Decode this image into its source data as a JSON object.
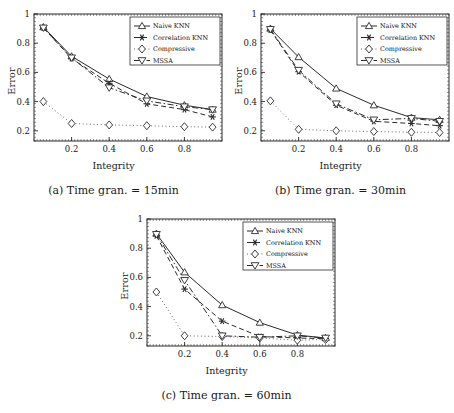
{
  "figure": {
    "ylabel": "Error",
    "xlabel": "Integrity",
    "yticks": [
      "0.2",
      "0.4",
      "0.6",
      "0.8",
      "1"
    ],
    "xticks": [
      "0.2",
      "0.4",
      "0.6",
      "0.8"
    ],
    "legend": [
      {
        "label": "Naive KNN",
        "marker": "triangle-up-icon",
        "line": "solid"
      },
      {
        "label": "Correlation KNN",
        "marker": "asterisk-icon",
        "line": "dashed"
      },
      {
        "label": "Compressive",
        "marker": "diamond-icon",
        "line": "dotted"
      },
      {
        "label": "MSSA",
        "marker": "triangle-down-icon",
        "line": "dashdot"
      }
    ]
  },
  "chart_data": [
    {
      "type": "line",
      "panel": "a",
      "title": "(a) Time gran. = 15min",
      "xlabel": "Integrity",
      "ylabel": "Error",
      "xlim": [
        0.0,
        1.0
      ],
      "ylim": [
        0.13,
        1.0
      ],
      "xticks": [
        0.2,
        0.4,
        0.6,
        0.8
      ],
      "yticks": [
        0.2,
        0.4,
        0.6,
        0.8,
        1.0
      ],
      "grid": false,
      "legend_position": "upper right",
      "x": [
        0.05,
        0.2,
        0.4,
        0.6,
        0.8,
        0.95
      ],
      "series": [
        {
          "name": "Naive KNN",
          "values": [
            0.91,
            0.71,
            0.555,
            0.435,
            0.375,
            0.345
          ]
        },
        {
          "name": "Correlation KNN",
          "values": [
            0.905,
            0.695,
            0.525,
            0.385,
            0.345,
            0.295
          ]
        },
        {
          "name": "Compressive",
          "values": [
            0.4,
            0.25,
            0.24,
            0.235,
            0.228,
            0.225
          ]
        },
        {
          "name": "MSSA",
          "values": [
            0.905,
            0.7,
            0.495,
            0.405,
            0.365,
            0.345
          ]
        }
      ]
    },
    {
      "type": "line",
      "panel": "b",
      "title": "(b) Time gran. = 30min",
      "xlabel": "Integrity",
      "ylabel": "Error",
      "xlim": [
        0.0,
        1.0
      ],
      "ylim": [
        0.13,
        1.0
      ],
      "xticks": [
        0.2,
        0.4,
        0.6,
        0.8
      ],
      "yticks": [
        0.2,
        0.4,
        0.6,
        0.8,
        1.0
      ],
      "grid": false,
      "legend_position": "upper right",
      "x": [
        0.05,
        0.2,
        0.4,
        0.6,
        0.8,
        0.95
      ],
      "series": [
        {
          "name": "Naive KNN",
          "values": [
            0.9,
            0.705,
            0.49,
            0.375,
            0.29,
            0.275
          ]
        },
        {
          "name": "Correlation KNN",
          "values": [
            0.89,
            0.605,
            0.375,
            0.265,
            0.25,
            0.235
          ]
        },
        {
          "name": "Compressive",
          "values": [
            0.405,
            0.21,
            0.2,
            0.195,
            0.19,
            0.188
          ]
        },
        {
          "name": "MSSA",
          "values": [
            0.895,
            0.615,
            0.385,
            0.275,
            0.285,
            0.265
          ]
        }
      ]
    },
    {
      "type": "line",
      "panel": "c",
      "title": "(c) Time gran. = 60min",
      "xlabel": "Integrity",
      "ylabel": "Error",
      "xlim": [
        0.0,
        1.0
      ],
      "ylim": [
        0.13,
        1.0
      ],
      "xticks": [
        0.2,
        0.4,
        0.6,
        0.8
      ],
      "yticks": [
        0.2,
        0.4,
        0.6,
        0.8,
        1.0
      ],
      "grid": false,
      "legend_position": "upper right",
      "x": [
        0.05,
        0.2,
        0.4,
        0.6,
        0.8,
        0.95
      ],
      "series": [
        {
          "name": "Naive KNN",
          "values": [
            0.9,
            0.635,
            0.41,
            0.29,
            0.205,
            0.185
          ]
        },
        {
          "name": "Correlation KNN",
          "values": [
            0.885,
            0.52,
            0.3,
            0.195,
            0.185,
            0.18
          ]
        },
        {
          "name": "Compressive",
          "values": [
            0.5,
            0.2,
            0.195,
            0.185,
            0.17,
            0.175
          ]
        },
        {
          "name": "MSSA",
          "values": [
            0.895,
            0.58,
            0.2,
            0.19,
            0.2,
            0.185
          ]
        }
      ]
    }
  ]
}
